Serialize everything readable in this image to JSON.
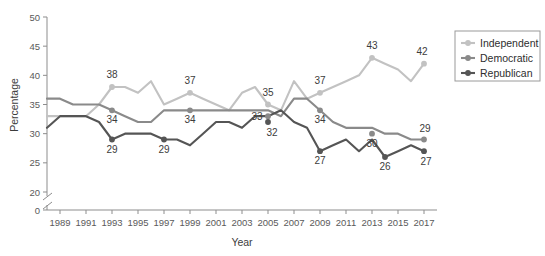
{
  "chart_data": {
    "type": "line",
    "title": "",
    "xlabel": "Year",
    "ylabel": "Percentage",
    "xlim": [
      1988,
      2018
    ],
    "ylim": [
      20,
      50
    ],
    "y_axis_break": true,
    "y_break_value": 0,
    "grid": false,
    "legend_position": "right",
    "x_tick_labels": [
      "1989",
      "1991",
      "1993",
      "1995",
      "1997",
      "1999",
      "2001",
      "2003",
      "2005",
      "2007",
      "2009",
      "2011",
      "2013",
      "2015",
      "2017"
    ],
    "y_tick_labels": [
      "0",
      "20",
      "25",
      "30",
      "35",
      "40",
      "45",
      "50"
    ],
    "x": [
      1988,
      1989,
      1990,
      1991,
      1992,
      1993,
      1994,
      1995,
      1996,
      1997,
      1998,
      1999,
      2000,
      2001,
      2002,
      2003,
      2004,
      2005,
      2006,
      2007,
      2008,
      2009,
      2010,
      2011,
      2012,
      2013,
      2014,
      2015,
      2016,
      2017
    ],
    "series": [
      {
        "name": "Independent",
        "color": "#c2c2c2",
        "values": [
          33,
          33,
          33,
          33,
          35,
          38,
          38,
          37,
          39,
          35,
          36,
          37,
          36,
          35,
          34,
          37,
          38,
          35,
          34,
          39,
          36,
          37,
          38,
          39,
          40,
          43,
          42,
          41,
          39,
          42
        ]
      },
      {
        "name": "Democratic",
        "color": "#8a8a8a",
        "values": [
          36,
          36,
          35,
          35,
          35,
          34,
          33,
          32,
          32,
          34,
          34,
          34,
          34,
          34,
          34,
          34,
          34,
          34,
          33,
          36,
          36,
          34,
          32,
          31,
          31,
          31,
          30,
          30,
          29,
          29
        ]
      },
      {
        "name": "Republican",
        "color": "#555555",
        "values": [
          31,
          33,
          33,
          33,
          32,
          29,
          30,
          30,
          30,
          29,
          29,
          28,
          30,
          32,
          32,
          31,
          33,
          33,
          34,
          32,
          31,
          27,
          28,
          29,
          27,
          29,
          26,
          27,
          28,
          27
        ]
      }
    ],
    "point_labels": [
      {
        "series": "Independent",
        "year": 1993,
        "value": 38,
        "text": "38"
      },
      {
        "series": "Independent",
        "year": 1999,
        "value": 37,
        "text": "37"
      },
      {
        "series": "Independent",
        "year": 2005,
        "value": 35,
        "text": "35"
      },
      {
        "series": "Independent",
        "year": 2009,
        "value": 37,
        "text": "37"
      },
      {
        "series": "Independent",
        "year": 2013,
        "value": 43,
        "text": "43"
      },
      {
        "series": "Independent",
        "year": 2017,
        "value": 42,
        "text": "42"
      },
      {
        "series": "Democratic",
        "year": 1993,
        "value": 34,
        "text": "34"
      },
      {
        "series": "Democratic",
        "year": 1999,
        "value": 34,
        "text": "34"
      },
      {
        "series": "Democratic",
        "year": 2005,
        "value": 33,
        "text": "33"
      },
      {
        "series": "Democratic",
        "year": 2009,
        "value": 34,
        "text": "34"
      },
      {
        "series": "Democratic",
        "year": 2013,
        "value": 30,
        "text": "30"
      },
      {
        "series": "Democratic",
        "year": 2017,
        "value": 29,
        "text": "29"
      },
      {
        "series": "Republican",
        "year": 1993,
        "value": 29,
        "text": "29"
      },
      {
        "series": "Republican",
        "year": 1997,
        "value": 29,
        "text": "29"
      },
      {
        "series": "Republican",
        "year": 2005,
        "value": 32,
        "text": "32"
      },
      {
        "series": "Republican",
        "year": 2009,
        "value": 27,
        "text": "27"
      },
      {
        "series": "Republican",
        "year": 2014,
        "value": 26,
        "text": "26"
      },
      {
        "series": "Republican",
        "year": 2017,
        "value": 27,
        "text": "27"
      }
    ]
  },
  "legend": {
    "items": [
      {
        "label": "Independent",
        "color": "#c2c2c2"
      },
      {
        "label": "Democratic",
        "color": "#8a8a8a"
      },
      {
        "label": "Republican",
        "color": "#555555"
      }
    ]
  },
  "axes": {
    "y_title": "Percentage",
    "x_title": "Year"
  }
}
